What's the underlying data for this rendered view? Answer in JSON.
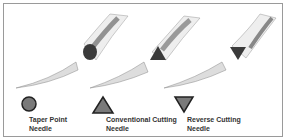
{
  "legend": [
    {
      "shape": "circle-icon",
      "line1": "Taper Point",
      "line2": "Needle"
    },
    {
      "shape": "triangle-up-icon",
      "line1": "Conventional Cutting",
      "line2": "Needle"
    },
    {
      "shape": "triangle-down-icon",
      "line1": "Reverse Cutting",
      "line2": "Needle"
    }
  ],
  "colors": {
    "fill": "#7a7a7a",
    "dark": "#3a3a3a",
    "stroke": "#222222"
  }
}
